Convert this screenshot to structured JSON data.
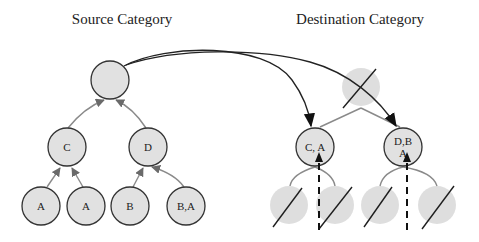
{
  "titles": {
    "source": "Source Category",
    "destination": "Destination Category"
  },
  "source_tree": {
    "root": {
      "label": ""
    },
    "level1": [
      {
        "label": "C"
      },
      {
        "label": "D"
      }
    ],
    "leaves": [
      {
        "label": "A"
      },
      {
        "label": "A"
      },
      {
        "label": "B"
      },
      {
        "label": "B,A"
      }
    ]
  },
  "destination_tree": {
    "root": {
      "label": "",
      "crossed_out": true
    },
    "level1": [
      {
        "label": "C, A"
      },
      {
        "label_line1": "D,B",
        "label_line2": "A"
      }
    ],
    "leaves": [
      {
        "label": "",
        "crossed_out": true
      },
      {
        "label": "",
        "crossed_out": true
      },
      {
        "label": "",
        "crossed_out": true
      },
      {
        "label": "",
        "crossed_out": true
      }
    ]
  },
  "colors": {
    "node_fill": "#e1e1e1",
    "faded_node_fill": "#dcdcdc",
    "edge_gray": "#8a8a8a",
    "arrow_dark": "#111111"
  }
}
